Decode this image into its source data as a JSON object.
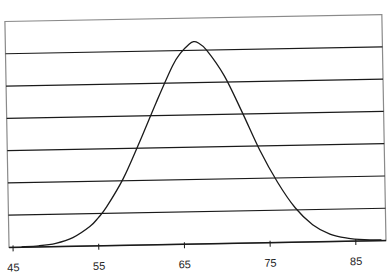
{
  "chart_data": {
    "type": "line",
    "title": "",
    "xlabel": "",
    "ylabel": "",
    "xlim": [
      45,
      89
    ],
    "x_ticks": [
      45,
      55,
      65,
      75,
      85
    ],
    "x_tick_labels": [
      "45",
      "55",
      "65",
      "75",
      "85"
    ],
    "y_ticks_shown": false,
    "gridlines": 6,
    "grid": true,
    "legend": null,
    "series": [
      {
        "name": "distribution",
        "x": [
          46,
          48,
          50,
          52,
          54,
          55,
          56,
          58,
          60,
          62,
          64,
          65,
          66,
          66.5,
          67,
          68,
          70,
          72,
          74,
          76,
          78,
          80,
          82,
          84,
          86,
          88
        ],
        "y": [
          0.2,
          0.5,
          1.5,
          4,
          9,
          13,
          18,
          31,
          48,
          66,
          83,
          89,
          93,
          94,
          93.5,
          90,
          78,
          61,
          43,
          28,
          16,
          8,
          3.5,
          1.5,
          0.6,
          0.3
        ]
      }
    ],
    "ylim": [
      0,
      105
    ],
    "line_color": "#1a1a1a",
    "grid_color": "#1a1a1a",
    "frame_color": "#8a8a8a"
  }
}
